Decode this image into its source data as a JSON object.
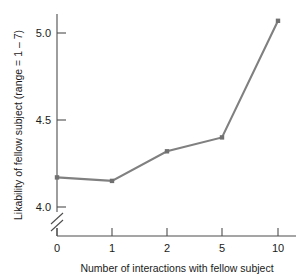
{
  "chart_data": {
    "type": "line",
    "title": "",
    "xlabel": "Number of interactions with fellow subject",
    "ylabel": "Likability of fellow subject (range = 1 – 7)",
    "categories": [
      "0",
      "1",
      "2",
      "5",
      "10"
    ],
    "x": [
      0,
      1,
      2,
      5,
      10
    ],
    "values": [
      4.17,
      4.15,
      4.32,
      4.4,
      5.07
    ],
    "series": [
      {
        "name": "Likability",
        "values": [
          4.17,
          4.15,
          4.32,
          4.4,
          5.07
        ]
      }
    ],
    "ytick_labels": [
      "4.0",
      "4.5",
      "5.0"
    ],
    "ytick_values": [
      4.0,
      4.5,
      5.0
    ],
    "ylim": [
      3.95,
      5.15
    ],
    "xtick_labels": [
      "0",
      "1",
      "2",
      "5",
      "10"
    ],
    "grid": false,
    "legend": false,
    "y_axis_break": true,
    "line_color": "#808080",
    "marker_color": "#707070",
    "axis_color": "#4d4d4d",
    "marker": "square",
    "x_scale": "categorical"
  },
  "labels": {
    "y_tick_0": "4.0",
    "y_tick_1": "4.5",
    "y_tick_2": "5.0",
    "x_tick_0": "0",
    "x_tick_1": "1",
    "x_tick_2": "2",
    "x_tick_3": "5",
    "x_tick_4": "10",
    "x_axis_title": "Number of interactions with fellow subject",
    "y_axis_title": "Likability of fellow subject (range = 1 – 7)"
  }
}
